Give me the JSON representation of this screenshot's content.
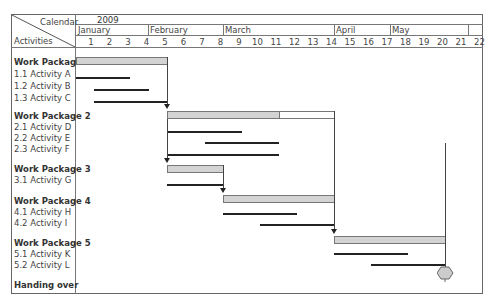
{
  "header": {
    "corner_top": "Calendar",
    "corner_bottom": "Activities",
    "year": "2009",
    "months": [
      {
        "label": "January",
        "x": 76,
        "w": 72
      },
      {
        "label": "February",
        "x": 148,
        "w": 75
      },
      {
        "label": "March",
        "x": 223,
        "w": 111
      },
      {
        "label": "April",
        "x": 334,
        "w": 56
      },
      {
        "label": "May",
        "x": 390,
        "w": 78
      },
      {
        "label": "",
        "x": 468,
        "w": 15
      }
    ],
    "weeks": [
      "1",
      "2",
      "3",
      "4",
      "5",
      "6",
      "7",
      "8",
      "9",
      "10",
      "11",
      "12",
      "13",
      "14",
      "15",
      "16",
      "17",
      "18",
      "19",
      "20",
      "21",
      "22"
    ]
  },
  "rows": [
    {
      "label": "Work Package 1",
      "type": "package",
      "y": 57
    },
    {
      "label": "1.1  Activity A",
      "type": "activity",
      "y": 69
    },
    {
      "label": "1.2  Activity B",
      "type": "activity",
      "y": 81
    },
    {
      "label": "1.3  Activity C",
      "type": "activity",
      "y": 93
    },
    {
      "label": "Work Package 2",
      "type": "package",
      "y": 111
    },
    {
      "label": "2.1  Activity D",
      "type": "activity",
      "y": 122
    },
    {
      "label": "2.2  Activity E",
      "type": "activity",
      "y": 133
    },
    {
      "label": "2.3  Activity F",
      "type": "activity",
      "y": 144
    },
    {
      "label": "Work Package 3",
      "type": "package",
      "y": 164
    },
    {
      "label": "3.1  Activity G",
      "type": "activity",
      "y": 175
    },
    {
      "label": "Work Package 4",
      "type": "package",
      "y": 196
    },
    {
      "label": "4.1  Activity H",
      "type": "activity",
      "y": 207
    },
    {
      "label": "4.2  Activity I",
      "type": "activity",
      "y": 218
    },
    {
      "label": "Work Package 5",
      "type": "package",
      "y": 238
    },
    {
      "label": "5.1  Activity K",
      "type": "activity",
      "y": 249
    },
    {
      "label": "5.2  Activity L",
      "type": "activity",
      "y": 260
    },
    {
      "label": "Handing over",
      "type": "milestone",
      "y": 280
    }
  ],
  "chart_data": {
    "type": "gantt",
    "title": "",
    "calendar_label": "Calendar",
    "activities_label": "Activities",
    "year": "2009",
    "months": [
      "January",
      "February",
      "March",
      "April",
      "May"
    ],
    "weeks": [
      1,
      2,
      3,
      4,
      5,
      6,
      7,
      8,
      9,
      10,
      11,
      12,
      13,
      14,
      15,
      16,
      17,
      18,
      19,
      20,
      21,
      22
    ],
    "tasks": [
      {
        "name": "Work Package 1",
        "kind": "package",
        "start_week": 1,
        "end_week": 5
      },
      {
        "name": "1.1 Activity A",
        "kind": "activity",
        "start_week": 1,
        "end_week": 3
      },
      {
        "name": "1.2 Activity B",
        "kind": "activity",
        "start_week": 2,
        "end_week": 4
      },
      {
        "name": "1.3 Activity C",
        "kind": "activity",
        "start_week": 2,
        "end_week": 5
      },
      {
        "name": "Work Package 2",
        "kind": "package",
        "start_week": 6,
        "end_week": 14,
        "progress_end_week": 11
      },
      {
        "name": "2.1 Activity D",
        "kind": "activity",
        "start_week": 6,
        "end_week": 9
      },
      {
        "name": "2.2 Activity E",
        "kind": "activity",
        "start_week": 8,
        "end_week": 11
      },
      {
        "name": "2.3 Activity F",
        "kind": "activity",
        "start_week": 6,
        "end_week": 11
      },
      {
        "name": "Work Package 3",
        "kind": "package",
        "start_week": 6,
        "end_week": 8
      },
      {
        "name": "3.1 Activity G",
        "kind": "activity",
        "start_week": 6,
        "end_week": 8
      },
      {
        "name": "Work Package 4",
        "kind": "package",
        "start_week": 9,
        "end_week": 14
      },
      {
        "name": "4.1 Activity H",
        "kind": "activity",
        "start_week": 9,
        "end_week": 12
      },
      {
        "name": "4.2 Activity I",
        "kind": "activity",
        "start_week": 11,
        "end_week": 14
      },
      {
        "name": "Work Package 5",
        "kind": "package",
        "start_week": 15,
        "end_week": 20
      },
      {
        "name": "5.1 Activity K",
        "kind": "activity",
        "start_week": 15,
        "end_week": 18
      },
      {
        "name": "5.2 Activity L",
        "kind": "activity",
        "start_week": 17,
        "end_week": 20
      },
      {
        "name": "Handing over",
        "kind": "milestone",
        "week": 20
      }
    ],
    "dependencies": [
      {
        "from": "Work Package 1",
        "to": "Work Package 2"
      },
      {
        "from": "Work Package 2",
        "to": "Work Package 3"
      },
      {
        "from": "Work Package 3",
        "to": "Work Package 4"
      },
      {
        "from": "Work Package 4",
        "to": "Work Package 5"
      },
      {
        "from": "Work Package 5",
        "to": "Handing over"
      }
    ],
    "grid": false,
    "legend": null
  },
  "bars": {
    "packages": [
      {
        "x": 76,
        "x2": 167,
        "y": 57,
        "grey_end": 167
      },
      {
        "x": 167,
        "x2": 334,
        "y": 111,
        "grey_end": 279
      },
      {
        "x": 167,
        "x2": 223,
        "y": 165,
        "grey_end": 223
      },
      {
        "x": 223,
        "x2": 334,
        "y": 195,
        "grey_end": 334
      },
      {
        "x": 334,
        "x2": 445,
        "y": 236,
        "grey_end": 445
      }
    ],
    "activities": [
      {
        "x": 76,
        "x2": 130,
        "y": 77
      },
      {
        "x": 94,
        "x2": 149,
        "y": 89
      },
      {
        "x": 94,
        "x2": 167,
        "y": 101
      },
      {
        "x": 167,
        "x2": 242,
        "y": 131
      },
      {
        "x": 205,
        "x2": 279,
        "y": 142
      },
      {
        "x": 167,
        "x2": 279,
        "y": 154
      },
      {
        "x": 167,
        "x2": 223,
        "y": 184
      },
      {
        "x": 223,
        "x2": 297,
        "y": 213
      },
      {
        "x": 260,
        "x2": 334,
        "y": 224
      },
      {
        "x": 334,
        "x2": 408,
        "y": 253
      },
      {
        "x": 371,
        "x2": 445,
        "y": 264
      }
    ]
  },
  "colors": {
    "package_fill": "#d3d3d3",
    "activity_line": "#222222",
    "border": "#666666",
    "milestone_fill": "#cccccc"
  }
}
